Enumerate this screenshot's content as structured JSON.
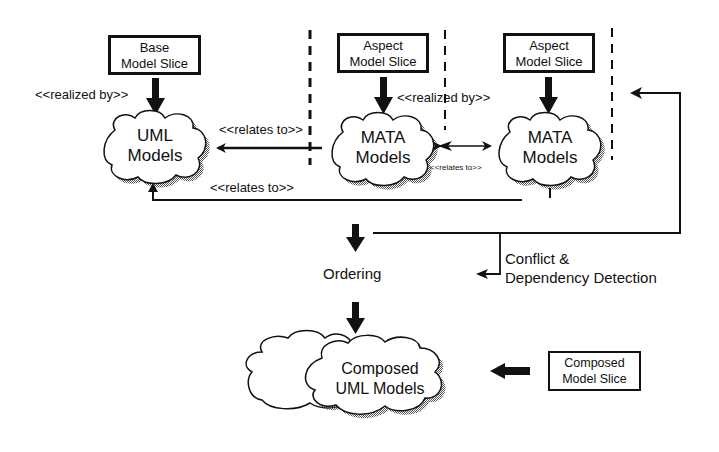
{
  "diagram": {
    "boxes": {
      "base": {
        "line1": "Base",
        "line2": "Model Slice"
      },
      "aspect1": {
        "line1": "Aspect",
        "line2": "Model Slice"
      },
      "aspect2": {
        "line1": "Aspect",
        "line2": "Model Slice"
      },
      "composed": {
        "line1": "Composed",
        "line2": "Model Slice"
      }
    },
    "clouds": {
      "uml": {
        "line1": "UML",
        "line2": "Models"
      },
      "mata1": {
        "line1": "MATA",
        "line2": "Models"
      },
      "mata2": {
        "line1": "MATA",
        "line2": "Models"
      },
      "composed": {
        "line1": "Composed",
        "line2": "UML Models"
      }
    },
    "labels": {
      "realized_by_left": "<<realized by>>",
      "realized_by_mid": "<<realized by>>",
      "relates_to_upper": "<<relates to>>",
      "relates_to_lower": "<<relates to>>",
      "relates_to_small": "<<relates to>>",
      "ordering": "Ordering",
      "conflict_line1": "Conflict &",
      "conflict_line2": "Dependency Detection"
    }
  }
}
